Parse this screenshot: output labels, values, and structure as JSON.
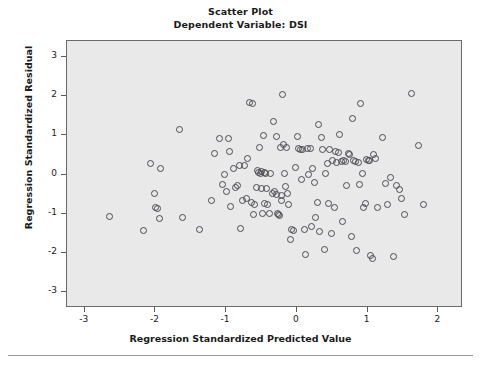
{
  "chart_data": {
    "type": "scatter",
    "title": "Scatter Plot",
    "subtitle": "Dependent Variable: DSI",
    "xlabel": "Regression Standardized Predicted Value",
    "ylabel": "Regression Standardized Residual",
    "xlim": [
      -3.25,
      2.35
    ],
    "ylim": [
      -3.4,
      3.4
    ],
    "xticks": [
      -3,
      -2,
      -1,
      0,
      1,
      2
    ],
    "xtick_labels": [
      "-3",
      "-2",
      "-1",
      "0",
      "1",
      "2"
    ],
    "yticks": [
      -3,
      -2,
      -1,
      0,
      1,
      2,
      3
    ],
    "ytick_labels": [
      "-3",
      "-2",
      "-1",
      "0",
      "1",
      "2",
      "3"
    ],
    "grid": false,
    "panel_background": "#e9e9e9",
    "marker": "open-circle",
    "marker_color": "#4a4a52",
    "n_points": 137,
    "points": [
      [
        -2.66,
        -1.05
      ],
      [
        -2.18,
        -1.42
      ],
      [
        -2.07,
        0.3
      ],
      [
        -2.02,
        -0.48
      ],
      [
        -2.0,
        -0.83
      ],
      [
        -1.98,
        -0.85
      ],
      [
        -1.95,
        -1.12
      ],
      [
        -1.93,
        0.17
      ],
      [
        -1.67,
        1.15
      ],
      [
        -1.62,
        -1.09
      ],
      [
        -1.38,
        -1.38
      ],
      [
        -1.22,
        -0.64
      ],
      [
        -1.17,
        0.56
      ],
      [
        -1.1,
        0.93
      ],
      [
        -1.06,
        -0.24
      ],
      [
        -1.03,
        0.01
      ],
      [
        -1.0,
        -0.43
      ],
      [
        -0.98,
        0.92
      ],
      [
        -0.96,
        0.59
      ],
      [
        -0.94,
        -0.8
      ],
      [
        -0.9,
        0.17
      ],
      [
        -0.87,
        -0.32
      ],
      [
        -0.85,
        -0.27
      ],
      [
        -0.82,
        0.24
      ],
      [
        -0.8,
        -1.37
      ],
      [
        -0.78,
        -0.65
      ],
      [
        -0.74,
        0.25
      ],
      [
        -0.72,
        -0.59
      ],
      [
        -0.7,
        0.41
      ],
      [
        -0.68,
        1.84
      ],
      [
        -0.65,
        -0.69
      ],
      [
        -0.64,
        1.82
      ],
      [
        -0.62,
        -1.01
      ],
      [
        -0.6,
        -0.74
      ],
      [
        -0.58,
        -0.32
      ],
      [
        -0.56,
        0.12
      ],
      [
        -0.55,
        0.07
      ],
      [
        -0.54,
        0.7
      ],
      [
        -0.52,
        0.05
      ],
      [
        -0.51,
        0.08
      ],
      [
        -0.5,
        -0.35
      ],
      [
        -0.49,
        -0.98
      ],
      [
        -0.48,
        1.0
      ],
      [
        -0.47,
        -0.72
      ],
      [
        -0.46,
        0.06
      ],
      [
        -0.45,
        0.04
      ],
      [
        -0.43,
        -0.34
      ],
      [
        -0.42,
        -0.76
      ],
      [
        -0.4,
        -0.99
      ],
      [
        -0.38,
        0.03
      ],
      [
        -0.35,
        -0.46
      ],
      [
        -0.33,
        1.36
      ],
      [
        -0.32,
        -0.42
      ],
      [
        -0.3,
        0.99
      ],
      [
        -0.29,
        -0.5
      ],
      [
        -0.28,
        -0.97
      ],
      [
        -0.26,
        -1.0
      ],
      [
        -0.25,
        -1.02
      ],
      [
        -0.24,
        0.71
      ],
      [
        -0.23,
        -0.53
      ],
      [
        -0.22,
        -0.66
      ],
      [
        -0.21,
        2.06
      ],
      [
        -0.2,
        0.78
      ],
      [
        -0.18,
        0.04
      ],
      [
        -0.17,
        -0.3
      ],
      [
        -0.15,
        0.69
      ],
      [
        -0.14,
        -0.48
      ],
      [
        -0.12,
        -0.74
      ],
      [
        -0.1,
        -1.65
      ],
      [
        -0.08,
        -1.39
      ],
      [
        -0.06,
        -1.41
      ],
      [
        -0.02,
        0.18
      ],
      [
        0.0,
        0.99
      ],
      [
        0.02,
        0.68
      ],
      [
        0.04,
        0.66
      ],
      [
        0.06,
        -0.12
      ],
      [
        0.08,
        0.65
      ],
      [
        0.1,
        -1.4
      ],
      [
        0.12,
        -2.02
      ],
      [
        0.14,
        0.68
      ],
      [
        0.16,
        0.02
      ],
      [
        0.18,
        0.68
      ],
      [
        0.2,
        -1.32
      ],
      [
        0.22,
        0.16
      ],
      [
        0.24,
        -0.18
      ],
      [
        0.26,
        -1.07
      ],
      [
        0.28,
        -0.71
      ],
      [
        0.3,
        1.28
      ],
      [
        0.32,
        -1.43
      ],
      [
        0.34,
        0.95
      ],
      [
        0.36,
        0.64
      ],
      [
        0.38,
        -1.89
      ],
      [
        0.4,
        0.05
      ],
      [
        0.42,
        0.3
      ],
      [
        0.44,
        -0.72
      ],
      [
        0.46,
        0.66
      ],
      [
        0.48,
        -1.49
      ],
      [
        0.5,
        0.38
      ],
      [
        0.52,
        -0.83
      ],
      [
        0.54,
        0.6
      ],
      [
        0.56,
        0.33
      ],
      [
        0.58,
        0.58
      ],
      [
        0.6,
        1.04
      ],
      [
        0.62,
        0.34
      ],
      [
        0.64,
        -1.18
      ],
      [
        0.66,
        0.36
      ],
      [
        0.68,
        0.35
      ],
      [
        0.7,
        -0.26
      ],
      [
        0.72,
        0.55
      ],
      [
        0.74,
        0.53
      ],
      [
        0.76,
        -1.57
      ],
      [
        0.78,
        1.44
      ],
      [
        0.8,
        0.38
      ],
      [
        0.82,
        0.35
      ],
      [
        0.84,
        -1.92
      ],
      [
        0.86,
        0.32
      ],
      [
        0.88,
        -0.25
      ],
      [
        0.9,
        1.83
      ],
      [
        0.92,
        0.03
      ],
      [
        0.94,
        -0.82
      ],
      [
        0.96,
        -0.73
      ],
      [
        0.98,
        0.39
      ],
      [
        1.0,
        0.37
      ],
      [
        1.02,
        0.38
      ],
      [
        1.04,
        -2.05
      ],
      [
        1.06,
        -2.12
      ],
      [
        1.08,
        0.51
      ],
      [
        1.1,
        0.41
      ],
      [
        1.14,
        -0.84
      ],
      [
        1.2,
        0.95
      ],
      [
        1.24,
        -0.21
      ],
      [
        1.28,
        -0.74
      ],
      [
        1.32,
        -0.07
      ],
      [
        1.36,
        -2.08
      ],
      [
        1.4,
        -0.26
      ],
      [
        1.44,
        -0.38
      ],
      [
        1.48,
        -0.59
      ],
      [
        1.52,
        -1.01
      ],
      [
        1.62,
        2.08
      ],
      [
        1.72,
        0.76
      ],
      [
        1.78,
        -0.76
      ]
    ]
  }
}
